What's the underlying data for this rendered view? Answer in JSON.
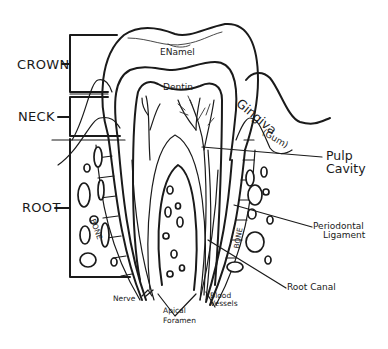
{
  "diagram": {
    "type": "anatomical-line-drawing",
    "colors": {
      "ink": "#1a1a1a",
      "background": "#ffffff"
    },
    "regions": {
      "crown": "CROWN",
      "neck": "NECK",
      "root": "ROOT"
    },
    "labels": {
      "enamel": "ENamel",
      "dentin": "Dentin",
      "gingiva_line1": "Gingiva",
      "gingiva_line2": "(Gum)",
      "pulp_line1": "Pulp",
      "pulp_line2": "Cavity",
      "periodontal_line1": "Periodontal",
      "periodontal_line2": "Ligament",
      "root_canal": "Root Canal",
      "bone_left": "BONE",
      "bone_right": "BONE",
      "nerve": "Nerve",
      "apical_line1": "Apical",
      "apical_line2": "Foramen",
      "blood_line1": "Blood",
      "blood_line2": "Vessels"
    }
  }
}
